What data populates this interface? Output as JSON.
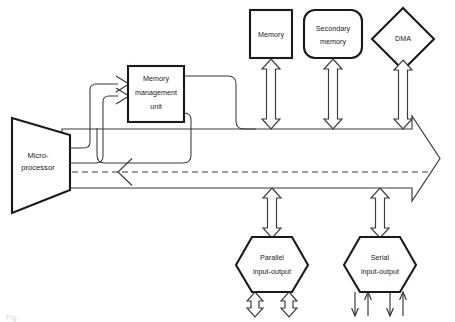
{
  "figure": {
    "caption": "Fig.",
    "background_color": "#ffffff",
    "line_color": "#3a3a3a",
    "shape_color": "#1a1a1a"
  },
  "nodes": {
    "microprocessor": {
      "label_line1": "Micro-",
      "label_line2": "processor",
      "shape": "trapezoid"
    },
    "mmu": {
      "label_line1": "Memory",
      "label_line2": "management",
      "label_line3": "unit",
      "shape": "rectangle"
    },
    "memory": {
      "label": "Memory",
      "shape": "rectangle"
    },
    "secondary_memory": {
      "label_line1": "Secondary",
      "label_line2": "memory",
      "shape": "rounded-rectangle"
    },
    "dma": {
      "label": "DMA",
      "shape": "diamond"
    },
    "parallel_io": {
      "label_line1": "Parallel",
      "label_line2": "input-output",
      "shape": "hexagon"
    },
    "serial_io": {
      "label_line1": "Serial",
      "label_line2": "input-output",
      "shape": "hexagon"
    }
  },
  "connections": {
    "bus": {
      "name": "system-bus",
      "direction": "right",
      "style": "hollow-block-arrow"
    },
    "bus_reverse": {
      "name": "bus-reverse-arrowhead",
      "direction": "left"
    },
    "mmu_to_micro_1": {
      "name": "micro-to-mmu-upper",
      "direction": "right"
    },
    "mmu_to_micro_2": {
      "name": "micro-to-mmu-lower",
      "direction": "right"
    },
    "memory_bus": {
      "name": "memory-bus-link",
      "direction": "both"
    },
    "secondary_bus": {
      "name": "secondary-memory-bus-link",
      "direction": "both"
    },
    "dma_bus": {
      "name": "dma-bus-link",
      "direction": "both"
    },
    "parallel_bus": {
      "name": "parallel-io-bus-link",
      "direction": "both"
    },
    "serial_bus": {
      "name": "serial-io-bus-link",
      "direction": "both"
    },
    "parallel_out_left": {
      "name": "parallel-io-port-left",
      "direction": "both"
    },
    "parallel_out_right": {
      "name": "parallel-io-port-right",
      "direction": "both"
    },
    "serial_lines": {
      "name": "serial-io-lines",
      "directions": [
        "down",
        "up",
        "down",
        "up"
      ]
    }
  }
}
